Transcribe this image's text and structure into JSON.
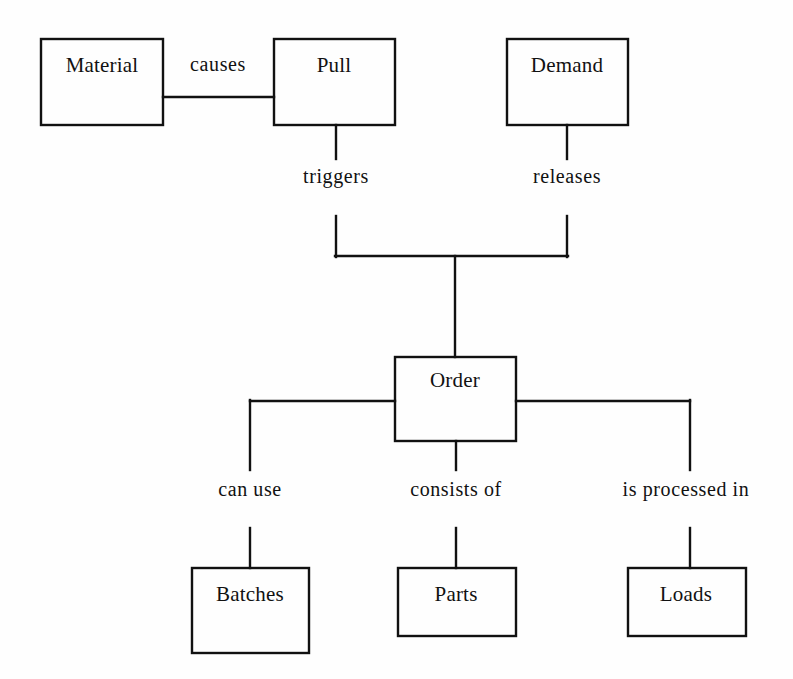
{
  "diagram": {
    "background_color": "#fefefe",
    "line_color": "#111111",
    "text_color": "#111111",
    "entities": [
      {
        "id": "material",
        "label": "Material",
        "x": 41,
        "y": 39,
        "w": 122,
        "h": 86,
        "cx": 102,
        "cy": 65
      },
      {
        "id": "pull",
        "label": "Pull",
        "x": 274,
        "y": 39,
        "w": 121,
        "h": 86,
        "cx": 334,
        "cy": 65
      },
      {
        "id": "demand",
        "label": "Demand",
        "x": 507,
        "y": 39,
        "w": 121,
        "h": 86,
        "cx": 567,
        "cy": 65
      },
      {
        "id": "order",
        "label": "Order",
        "x": 395,
        "y": 357,
        "w": 121,
        "h": 84,
        "cx": 455,
        "cy": 380
      },
      {
        "id": "batches",
        "label": "Batches",
        "x": 192,
        "y": 568,
        "w": 117,
        "h": 85,
        "cx": 250,
        "cy": 594
      },
      {
        "id": "parts",
        "label": "Parts",
        "x": 398,
        "y": 568,
        "w": 118,
        "h": 68,
        "cx": 456,
        "cy": 594
      },
      {
        "id": "loads",
        "label": "Loads",
        "x": 628,
        "y": 568,
        "w": 118,
        "h": 68,
        "cx": 686,
        "cy": 594
      }
    ],
    "relationships": [
      {
        "id": "causes",
        "label": "causes",
        "cx": 218,
        "cy": 64,
        "from": "material",
        "to": "pull"
      },
      {
        "id": "triggers",
        "label": "triggers",
        "cx": 336,
        "cy": 176,
        "from": "pull",
        "to": "order"
      },
      {
        "id": "releases",
        "label": "releases",
        "cx": 567,
        "cy": 176,
        "from": "demand",
        "to": "order"
      },
      {
        "id": "can-use",
        "label": "can use",
        "cx": 250,
        "cy": 489,
        "from": "order",
        "to": "batches"
      },
      {
        "id": "consists-of",
        "label": "consists of",
        "cx": 456,
        "cy": 489,
        "from": "order",
        "to": "parts"
      },
      {
        "id": "is-processed-in",
        "label": "is processed in",
        "cx": 686,
        "cy": 489,
        "from": "order",
        "to": "loads"
      }
    ]
  }
}
